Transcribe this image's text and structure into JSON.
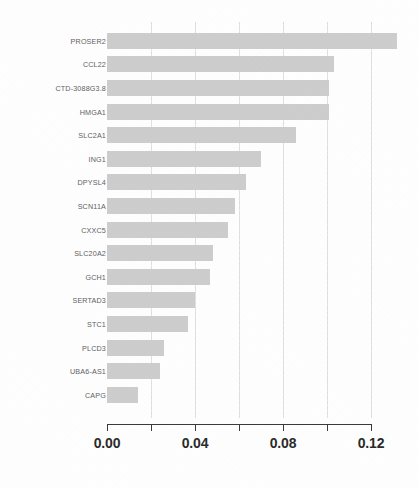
{
  "chart_data": {
    "type": "bar",
    "orientation": "horizontal",
    "title": "",
    "subtitle": "",
    "xlabel": "",
    "ylabel": "",
    "categories": [
      "PROSER2",
      "CCL22",
      "CTD-3088G3.8",
      "HMGA1",
      "SLC2A1",
      "ING1",
      "DPYSL4",
      "SCN11A",
      "CXXC5",
      "SLC20A2",
      "GCH1",
      "SERTAD3",
      "STC1",
      "PLCD3",
      "UBA6-AS1",
      "CAPG"
    ],
    "values": [
      0.132,
      0.103,
      0.101,
      0.101,
      0.086,
      0.07,
      0.063,
      0.058,
      0.055,
      0.048,
      0.047,
      0.04,
      0.037,
      0.026,
      0.024,
      0.014
    ],
    "xlim": [
      0.0,
      0.132
    ],
    "major_ticks": [
      0.0,
      0.04,
      0.08,
      0.12
    ],
    "minor_ticks": [
      0.02,
      0.06,
      0.1
    ],
    "tick_labels": [
      "0.00",
      "0.04",
      "0.08",
      "0.12"
    ],
    "gridlines": [
      0.02,
      0.04,
      0.06,
      0.08,
      0.1,
      0.12
    ],
    "grid": true,
    "legend": null,
    "bar_color": "#cdcdcd",
    "axis_color": "#3b3b3b",
    "grid_color": "#dddddd",
    "background_color": "#ffffff",
    "annotations": []
  }
}
